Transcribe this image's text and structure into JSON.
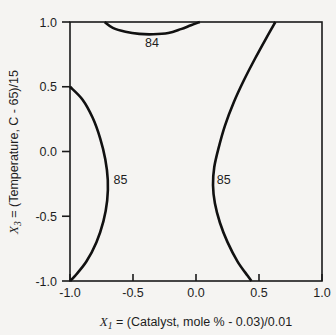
{
  "chart_data": {
    "type": "line",
    "title": "",
    "subtitle": "",
    "xlabel": "X1 = (Catalyst, mole % - 0.03)/0.01",
    "ylabel": "X3 = (Temperature, C - 65)/15",
    "xlabel_parts": {
      "var": "X",
      "sub": "1",
      "rest": " = (Catalyst, mole % - 0.03)/0.01"
    },
    "ylabel_parts": {
      "var": "X",
      "sub": "3",
      "rest": " = (Temperature, C - 65)/15"
    },
    "xlim": [
      -1.0,
      1.0
    ],
    "ylim": [
      -1.0,
      1.0
    ],
    "grid": false,
    "legend": "none",
    "xticks": [
      "-1.0",
      "-0.5",
      "0.0",
      "0.5",
      "1.0"
    ],
    "xtick_values": [
      -1.0,
      -0.5,
      0.0,
      0.5,
      1.0
    ],
    "yticks": [
      "1.0",
      "0.5",
      "0.0",
      "-0.5",
      "-1.0"
    ],
    "ytick_values": [
      1.0,
      0.5,
      0.0,
      -0.5,
      -1.0
    ],
    "contour_levels": [
      84,
      85
    ],
    "series": [
      {
        "name": "84",
        "level": 84,
        "label": "84",
        "label_x": -0.35,
        "label_y": 0.84,
        "points": [
          [
            -0.725,
            1.0
          ],
          [
            -0.66,
            0.955
          ],
          [
            -0.56,
            0.925
          ],
          [
            -0.45,
            0.908
          ],
          [
            -0.34,
            0.905
          ],
          [
            -0.22,
            0.915
          ],
          [
            -0.12,
            0.945
          ],
          [
            -0.04,
            0.975
          ],
          [
            0.03,
            1.0
          ]
        ]
      },
      {
        "name": "85-left",
        "level": 85,
        "label": "85",
        "label_x": -0.6,
        "label_y": -0.22,
        "points": [
          [
            -1.0,
            0.5
          ],
          [
            -0.9,
            0.4
          ],
          [
            -0.82,
            0.26
          ],
          [
            -0.76,
            0.1
          ],
          [
            -0.72,
            -0.06
          ],
          [
            -0.7,
            -0.22
          ],
          [
            -0.705,
            -0.38
          ],
          [
            -0.735,
            -0.54
          ],
          [
            -0.79,
            -0.7
          ],
          [
            -0.87,
            -0.85
          ],
          [
            -0.96,
            -0.96
          ],
          [
            -1.0,
            -1.0
          ]
        ]
      },
      {
        "name": "85-right",
        "level": 85,
        "label": "85",
        "label_x": 0.22,
        "label_y": -0.22,
        "points": [
          [
            0.63,
            1.0
          ],
          [
            0.56,
            0.88
          ],
          [
            0.47,
            0.72
          ],
          [
            0.38,
            0.55
          ],
          [
            0.3,
            0.38
          ],
          [
            0.23,
            0.2
          ],
          [
            0.18,
            0.03
          ],
          [
            0.145,
            -0.12
          ],
          [
            0.135,
            -0.26
          ],
          [
            0.15,
            -0.4
          ],
          [
            0.19,
            -0.55
          ],
          [
            0.25,
            -0.7
          ],
          [
            0.33,
            -0.85
          ],
          [
            0.41,
            -0.96
          ],
          [
            0.44,
            -1.0
          ]
        ]
      }
    ]
  }
}
